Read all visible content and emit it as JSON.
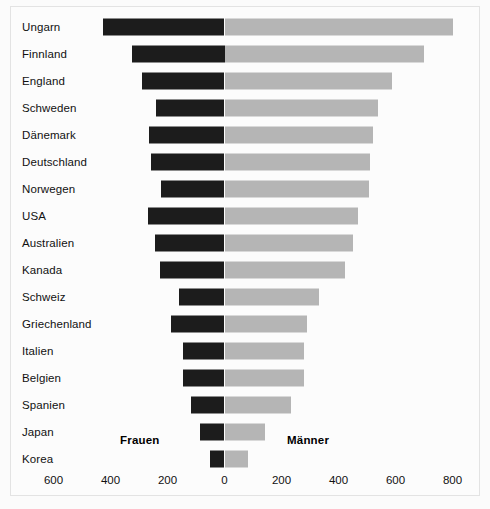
{
  "chart_data": {
    "type": "bar",
    "orientation": "horizontal",
    "layout": "diverging-butterfly",
    "title": "",
    "subtitle": "",
    "xlabel": "",
    "ylabel": "",
    "grid": false,
    "legend_position": "inside-bottom",
    "axis": {
      "zero_position": "center",
      "tick_labels": [
        "600",
        "400",
        "200",
        "0",
        "200",
        "400",
        "600",
        "800"
      ],
      "tick_values": [
        -600,
        -400,
        -200,
        0,
        200,
        400,
        600,
        800
      ],
      "xlim": [
        -700,
        850
      ]
    },
    "series": [
      {
        "name": "Frauen",
        "color": "#1c1c1c",
        "side": "left",
        "values": [
          428,
          325,
          288,
          240,
          265,
          258,
          223,
          268,
          244,
          226,
          160,
          188,
          146,
          146,
          118,
          86,
          51
        ]
      },
      {
        "name": "Männer",
        "color": "#b5b5b5",
        "side": "right",
        "values": [
          800,
          700,
          588,
          539,
          521,
          511,
          507,
          469,
          451,
          423,
          332,
          290,
          279,
          279,
          233,
          142,
          82
        ]
      }
    ],
    "categories": [
      "Ungarn",
      "Finnland",
      "England",
      "Schweden",
      "Dänemark",
      "Deutschland",
      "Norwegen",
      "USA",
      "Australien",
      "Kanada",
      "Schweiz",
      "Griechenland",
      "Italien",
      "Belgien",
      "Spanien",
      "Japan",
      "Korea"
    ],
    "annotations": [
      {
        "text": "Frauen",
        "name": "frauen"
      },
      {
        "text": "Männer",
        "name": "maenner"
      }
    ]
  }
}
